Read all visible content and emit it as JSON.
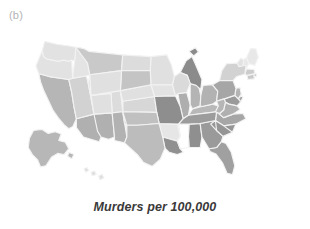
{
  "panel": {
    "label": "(b)",
    "caption": "Murders per 100,000"
  },
  "style": {
    "background": "#ffffff",
    "border_color": "#f2f2f2",
    "label_color": "#b4b4b4",
    "caption_color": "#3a3a3a"
  },
  "chart_data": {
    "type": "heatmap",
    "subtype": "choropleth-map",
    "title": "Murders per 100,000",
    "panel_label": "(b)",
    "region": "United States",
    "legend": null,
    "grid": false,
    "colormap": {
      "name": "grayscale",
      "low_color": "#ececec",
      "high_color": "#848484",
      "note": "darker gray = higher murder rate"
    },
    "value_unit": "murders per 100,000",
    "bins": [
      {
        "label": "lowest",
        "color": "#ececec"
      },
      {
        "label": "low",
        "color": "#e2e2e2"
      },
      {
        "label": "medium-low",
        "color": "#d4d4d4"
      },
      {
        "label": "medium",
        "color": "#c4c4c4"
      },
      {
        "label": "medium-high",
        "color": "#b0b0b0"
      },
      {
        "label": "high",
        "color": "#9c9c9c"
      },
      {
        "label": "highest",
        "color": "#888888"
      }
    ],
    "categories": [
      "AL",
      "AK",
      "AZ",
      "AR",
      "CA",
      "CO",
      "CT",
      "DE",
      "FL",
      "GA",
      "HI",
      "ID",
      "IL",
      "IN",
      "IA",
      "KS",
      "KY",
      "LA",
      "ME",
      "MD",
      "MA",
      "MI",
      "MN",
      "MS",
      "MO",
      "MT",
      "NE",
      "NV",
      "NH",
      "NJ",
      "NM",
      "NY",
      "NC",
      "ND",
      "OH",
      "OK",
      "OR",
      "PA",
      "RI",
      "SC",
      "SD",
      "TN",
      "TX",
      "UT",
      "VT",
      "VA",
      "WA",
      "WV",
      "WI",
      "WY"
    ],
    "values": [
      8.0,
      5.6,
      6.1,
      6.3,
      5.4,
      3.0,
      2.8,
      4.8,
      5.4,
      6.2,
      2.3,
      2.3,
      5.4,
      5.0,
      1.8,
      3.8,
      4.3,
      9.8,
      1.5,
      6.5,
      2.6,
      6.3,
      1.9,
      7.9,
      6.9,
      3.1,
      2.8,
      5.6,
      1.1,
      4.0,
      4.6,
      3.8,
      5.1,
      2.4,
      4.0,
      5.3,
      2.2,
      4.4,
      3.3,
      6.7,
      2.2,
      6.0,
      4.9,
      1.9,
      1.4,
      4.5,
      2.6,
      3.7,
      2.4,
      2.7
    ],
    "states": [
      {
        "code": "AL",
        "name": "Alabama",
        "value": 8.0,
        "color": "#8f8f8f"
      },
      {
        "code": "AK",
        "name": "Alaska",
        "value": 5.6,
        "color": "#b7b7b7"
      },
      {
        "code": "AZ",
        "name": "Arizona",
        "value": 6.1,
        "color": "#b0b0b0"
      },
      {
        "code": "AR",
        "name": "Arkansas",
        "value": 6.3,
        "color": "#e6e6e6"
      },
      {
        "code": "CA",
        "name": "California",
        "value": 5.4,
        "color": "#b6b6b6"
      },
      {
        "code": "CO",
        "name": "Colorado",
        "value": 3.0,
        "color": "#dcdcdc"
      },
      {
        "code": "CT",
        "name": "Connecticut",
        "value": 2.8,
        "color": "#c8c8c8"
      },
      {
        "code": "DE",
        "name": "Delaware",
        "value": 4.8,
        "color": "#a8a8a8"
      },
      {
        "code": "FL",
        "name": "Florida",
        "value": 5.4,
        "color": "#a0a0a0"
      },
      {
        "code": "GA",
        "name": "Georgia",
        "value": 6.2,
        "color": "#9a9a9a"
      },
      {
        "code": "HI",
        "name": "Hawaii",
        "value": 2.3,
        "color": "#dedede"
      },
      {
        "code": "ID",
        "name": "Idaho",
        "value": 2.3,
        "color": "#e4e4e4"
      },
      {
        "code": "IL",
        "name": "Illinois",
        "value": 5.4,
        "color": "#aeaeae"
      },
      {
        "code": "IN",
        "name": "Indiana",
        "value": 5.0,
        "color": "#b4b4b4"
      },
      {
        "code": "IA",
        "name": "Iowa",
        "value": 1.8,
        "color": "#e3e3e3"
      },
      {
        "code": "KS",
        "name": "Kansas",
        "value": 3.8,
        "color": "#d7d7d7"
      },
      {
        "code": "KY",
        "name": "Kentucky",
        "value": 4.3,
        "color": "#b8b8b8"
      },
      {
        "code": "LA",
        "name": "Louisiana",
        "value": 9.8,
        "color": "#909090"
      },
      {
        "code": "ME",
        "name": "Maine",
        "value": 1.5,
        "color": "#e8e8e8"
      },
      {
        "code": "MD",
        "name": "Maryland",
        "value": 6.5,
        "color": "#9a9a9a"
      },
      {
        "code": "MA",
        "name": "Massachusetts",
        "value": 2.6,
        "color": "#cccccc"
      },
      {
        "code": "MI",
        "name": "Michigan",
        "value": 6.3,
        "color": "#8b8b8b"
      },
      {
        "code": "MN",
        "name": "Minnesota",
        "value": 1.9,
        "color": "#e0e0e0"
      },
      {
        "code": "MS",
        "name": "Mississippi",
        "value": 7.9,
        "color": "#a2a2a2"
      },
      {
        "code": "MO",
        "name": "Missouri",
        "value": 6.9,
        "color": "#8e8e8e"
      },
      {
        "code": "MT",
        "name": "Montana",
        "value": 3.1,
        "color": "#c9c9c9"
      },
      {
        "code": "NE",
        "name": "Nebraska",
        "value": 2.8,
        "color": "#e0e0e0"
      },
      {
        "code": "NV",
        "name": "Nevada",
        "value": 5.6,
        "color": "#d2d2d2"
      },
      {
        "code": "NH",
        "name": "New Hampshire",
        "value": 1.1,
        "color": "#e8e8e8"
      },
      {
        "code": "NJ",
        "name": "New Jersey",
        "value": 4.0,
        "color": "#b4b4b4"
      },
      {
        "code": "NM",
        "name": "New Mexico",
        "value": 4.6,
        "color": "#b2b2b2"
      },
      {
        "code": "NY",
        "name": "New York",
        "value": 3.8,
        "color": "#d2d2d2"
      },
      {
        "code": "NC",
        "name": "North Carolina",
        "value": 5.1,
        "color": "#a6a6a6"
      },
      {
        "code": "ND",
        "name": "North Dakota",
        "value": 2.4,
        "color": "#dcdcdc"
      },
      {
        "code": "OH",
        "name": "Ohio",
        "value": 4.0,
        "color": "#b2b2b2"
      },
      {
        "code": "OK",
        "name": "Oklahoma",
        "value": 5.3,
        "color": "#c0c0c0"
      },
      {
        "code": "OR",
        "name": "Oregon",
        "value": 2.2,
        "color": "#e2e2e2"
      },
      {
        "code": "PA",
        "name": "Pennsylvania",
        "value": 4.4,
        "color": "#a6a6a6"
      },
      {
        "code": "RI",
        "name": "Rhode Island",
        "value": 3.3,
        "color": "#c4c4c4"
      },
      {
        "code": "SC",
        "name": "South Carolina",
        "value": 6.7,
        "color": "#959595"
      },
      {
        "code": "SD",
        "name": "South Dakota",
        "value": 2.2,
        "color": "#c4c4c4"
      },
      {
        "code": "TN",
        "name": "Tennessee",
        "value": 6.0,
        "color": "#9c9c9c"
      },
      {
        "code": "TX",
        "name": "Texas",
        "value": 4.9,
        "color": "#bcbcbc"
      },
      {
        "code": "UT",
        "name": "Utah",
        "value": 1.9,
        "color": "#e0e0e0"
      },
      {
        "code": "VT",
        "name": "Vermont",
        "value": 1.4,
        "color": "#e2e2e2"
      },
      {
        "code": "VA",
        "name": "Virginia",
        "value": 4.5,
        "color": "#b0b0b0"
      },
      {
        "code": "WA",
        "name": "Washington",
        "value": 2.6,
        "color": "#e2e2e2"
      },
      {
        "code": "WV",
        "name": "West Virginia",
        "value": 3.7,
        "color": "#b6b6b6"
      },
      {
        "code": "WI",
        "name": "Wisconsin",
        "value": 2.4,
        "color": "#dadada"
      },
      {
        "code": "WY",
        "name": "Wyoming",
        "value": 2.7,
        "color": "#e0e0e0"
      }
    ]
  }
}
